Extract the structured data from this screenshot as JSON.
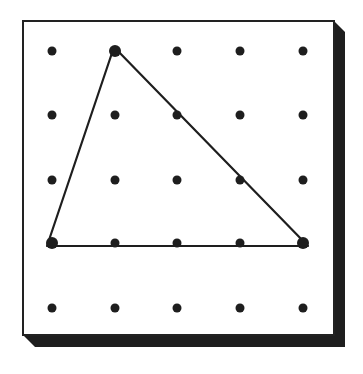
{
  "figure": {
    "type": "geoboard",
    "grid": {
      "rows": 5,
      "cols": 5
    },
    "colors": {
      "background": "#ffffff",
      "board_face": "#ffffff",
      "board_outline": "#222222",
      "board_shadow": "#1e1e1e",
      "peg": "#1e1e1e",
      "band": "#1e1e1e"
    },
    "board": {
      "face": {
        "x": 23,
        "y": 21,
        "width": 311,
        "height": 314
      },
      "shadow_depth": {
        "right": 11,
        "bottom": 12
      }
    },
    "peg_columns_x": [
      52,
      115,
      177,
      240,
      303
    ],
    "peg_rows_y": [
      51,
      115,
      180,
      243,
      308
    ],
    "peg_radius": 4.5,
    "shape": {
      "name": "triangle",
      "vertices_grid": [
        {
          "row": 0,
          "col": 1
        },
        {
          "row": 3,
          "col": 0
        },
        {
          "row": 3,
          "col": 4
        }
      ],
      "vertices_px": [
        {
          "x": 114,
          "y": 47
        },
        {
          "x": 47,
          "y": 246
        },
        {
          "x": 308,
          "y": 246
        }
      ],
      "band_width": 2.2
    }
  }
}
